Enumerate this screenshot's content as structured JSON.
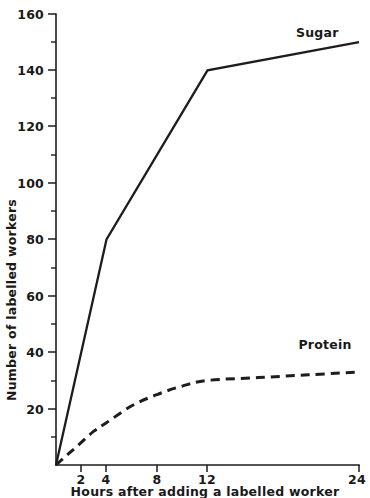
{
  "chart_data": {
    "type": "line",
    "title": "",
    "xlabel": "Hours after adding a labelled worker",
    "ylabel": "Number of labelled workers",
    "xlim": [
      0,
      24
    ],
    "ylim": [
      0,
      160
    ],
    "grid": false,
    "legend_position": "inline-end-of-curve",
    "x_ticks": [
      2,
      4,
      8,
      12,
      24
    ],
    "x_tick_labels": [
      "2",
      "4",
      "8",
      "12",
      "24"
    ],
    "y_ticks": [
      0,
      20,
      40,
      60,
      80,
      100,
      120,
      140,
      160
    ],
    "y_tick_labels": [
      "",
      "20",
      "40",
      "60",
      "80",
      "100",
      "120",
      "140",
      "160"
    ],
    "y_minor_ticks": [
      10,
      30,
      50,
      70,
      90,
      110,
      130,
      150
    ],
    "series": [
      {
        "name": "Sugar",
        "style": "solid",
        "color": "#1d1d1d",
        "x": [
          0,
          4,
          12,
          24
        ],
        "values": [
          0,
          80,
          140,
          150
        ],
        "label": "Sugar",
        "label_x": 19,
        "label_y": 152
      },
      {
        "name": "Protein",
        "style": "dashed",
        "color": "#1d1d1d",
        "x": [
          0,
          1,
          2,
          3,
          4,
          6,
          8,
          10,
          12,
          16,
          20,
          24
        ],
        "values": [
          0,
          4,
          8,
          12,
          15,
          21,
          25,
          28,
          30,
          31,
          32,
          33
        ],
        "label": "Protein",
        "label_x": 19.2,
        "label_y": 41
      }
    ]
  },
  "axis": {
    "y_tick_labels": [
      "160",
      "140",
      "120",
      "100",
      "80",
      "60",
      "40",
      "20"
    ],
    "x_tick_labels": [
      "2",
      "4",
      "8",
      "12",
      "24"
    ]
  },
  "labels": {
    "y_axis_title": "Number of labelled workers",
    "x_axis_title": "Hours after adding a labelled worker",
    "sugar": "Sugar",
    "protein": "Protein"
  },
  "colors": {
    "ink": "#1d1d1d",
    "background": "#ffffff"
  }
}
